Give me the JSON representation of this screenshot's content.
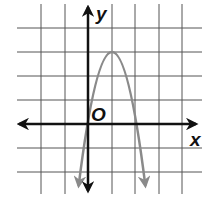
{
  "figure": {
    "type": "coordinate-plane-graph",
    "x_axis_label": "x",
    "y_axis_label": "y",
    "origin_label": "O",
    "grid": {
      "x_min": -3,
      "x_max": 4,
      "y_min": -2,
      "y_max": 4,
      "step": 1
    },
    "curve": {
      "kind": "parabola",
      "opens": "down",
      "vertex": [
        1,
        3
      ],
      "x_intercepts": [
        0,
        2
      ],
      "equation": "y = -3x^2 + 6x",
      "color": "#8a8a8a"
    },
    "colors": {
      "grid": "#555555",
      "axes": "#111111",
      "curve": "#8a8a8a"
    }
  }
}
